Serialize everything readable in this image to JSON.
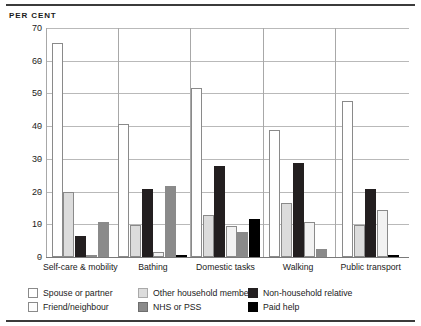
{
  "chart_data": {
    "type": "bar",
    "title": "",
    "subtitle": "",
    "xlabel": "",
    "ylabel": "PER CENT",
    "ylim": [
      0,
      70
    ],
    "yticks": [
      0,
      10,
      20,
      30,
      40,
      50,
      60,
      70
    ],
    "grid": true,
    "legend_position": "bottom",
    "categories": [
      "Self-care & mobility",
      "Bathing",
      "Domestic tasks",
      "Walking",
      "Public transport"
    ],
    "series": [
      {
        "name": "Spouse or partner",
        "color": "#ffffff",
        "values": [
          65.3,
          40.8,
          51.8,
          38.7,
          47.7
        ]
      },
      {
        "name": "Other household member",
        "color": "#dcdcdc",
        "values": [
          19.8,
          9.8,
          12.7,
          16.5,
          9.7
        ]
      },
      {
        "name": "Non-household relative",
        "color": "#231f20",
        "values": [
          6.5,
          20.7,
          27.8,
          28.8,
          20.7
        ]
      },
      {
        "name": "Friend/neighbour",
        "color": "#f2f2f2",
        "values": [
          0.6,
          1.4,
          9.6,
          10.7,
          14.5
        ]
      },
      {
        "name": "NHS or PSS",
        "color": "#8a8a8a",
        "values": [
          10.8,
          21.7,
          7.7,
          2.4,
          0.0
        ]
      },
      {
        "name": "Paid help",
        "color": "#000000",
        "values": [
          0.0,
          0.7,
          11.7,
          0.0,
          0.7
        ]
      }
    ]
  },
  "legend": {
    "items": [
      {
        "label": "Spouse or partner",
        "swatch": "#ffffff",
        "border": "#8a8a8a"
      },
      {
        "label": "Friend/neighbour",
        "swatch": "#fdfdfd",
        "border": "#8a8a8a"
      },
      {
        "label": "Other household member",
        "swatch": "#dcdcdc",
        "border": "#a9a9a9"
      },
      {
        "label": "NHS or PSS",
        "swatch": "#8a8a8a",
        "border": "#6e6e6e"
      },
      {
        "label": "Non-household relative",
        "swatch": "#231f20",
        "border": "#231f20"
      },
      {
        "label": "Paid help",
        "swatch": "#000000",
        "border": "#000000"
      }
    ]
  }
}
